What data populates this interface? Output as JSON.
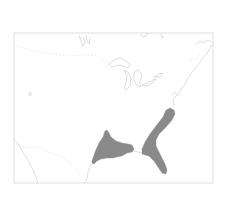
{
  "map": {
    "type": "species-range-map",
    "region": "Eastern United States",
    "frame": {
      "x": 14,
      "y": 33,
      "width": 199,
      "height": 150
    },
    "colors": {
      "background": "#ffffff",
      "range_fill": "#8a8a8a",
      "outline": "#c8c8c8",
      "frame": "#d6d6d6"
    },
    "range_areas": [
      {
        "name": "western-gulf-range",
        "d": "M92,161 L95,152 L99,143 L103,137 L105,131 L107,130 L109,133 L111,137 L116,141 L122,143 L128,144 L132,145 L134,149 L132,152 L127,153 L122,156 L117,157 L113,158 L107,158 L101,159 L97,161 L94,164 L92,163 Z"
      },
      {
        "name": "southeastern-range",
        "d": "M142,154 L142,149 L145,142 L150,134 L156,126 L163,117 L166,110 L170,108 L174,110 L175,114 L172,120 L166,127 L159,134 L156,140 L156,146 L159,152 L162,158 L165,164 L167,170 L166,174 L162,173 L158,167 L154,161 L149,156 L145,155 Z"
      }
    ],
    "coastlines": [
      "M14,139 L19,145 L24,154 L29,162 L33,170 L36,177 L38,183",
      "M85,183 L87,178 L88,172 L90,167 L92,163",
      "M134,151 L138,152 L142,153",
      "M174,106 L173,100 L176,96 L179,93 L182,88 L185,84 L187,80 L190,75 L194,70 L197,66 L200,62 L203,58 L206,55 L209,50 L212,45",
      "M179,96 L175,92 L172,95",
      "M212,42 L208,40 L204,43 L200,41 L196,44"
    ],
    "lakes": [
      "M109,64 L114,60 L120,58 L126,61 L130,64 L128,68 L123,66 L118,65 L112,67 Z",
      "M124,70 L127,76 L126,82 L124,88 L126,90 L130,86 L131,79 L129,73 Z",
      "M134,72 L138,70 L141,73 L142,78 L139,82 L141,86 L137,86 L134,80 Z",
      "M142,85 L148,83 L153,80 L156,79 L153,83 L147,86 Z",
      "M154,77 L158,74 L163,73 L160,77 Z",
      "M79,35 L81,41 L83,46 L85,43 L83,37",
      "M86,35 L87,42 L89,44 L90,38",
      "M140,34 L143,37 L146,36 L148,33",
      "M161,34 L162,38 L164,36"
    ],
    "borders": [
      "M16,46 L30,50 L50,54 L70,56 L88,55 L96,55 L104,61 L108,66",
      "M16,145 L25,147 L35,148 L40,147 L45,151 L52,153 L60,156 L68,162 L75,169 L80,177 L85,183",
      "M190,60 L196,58 L200,55"
    ],
    "markers": [
      {
        "name": "small-lake-west",
        "x": 30,
        "y": 94,
        "label": ""
      }
    ]
  }
}
